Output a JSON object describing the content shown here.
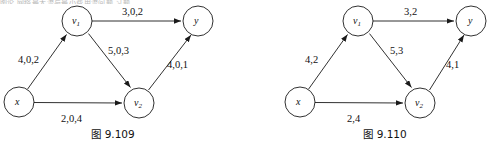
{
  "page": {
    "background_color": "#ffffff",
    "width": 490,
    "height": 151,
    "top_cut_text": "图论 网络最大流与最小费用流问题 习题"
  },
  "figures": [
    {
      "id": "fig-9-109",
      "caption": "图 9.109",
      "caption_x": 110,
      "caption_y": 128,
      "origin_x": 0,
      "stroke_color": "#1a1a1a",
      "nodes": [
        {
          "id": "x",
          "label": "x",
          "sub": "",
          "cx": 19,
          "cy": 102,
          "r": 15
        },
        {
          "id": "v1",
          "label": "v",
          "sub": "1",
          "cx": 77,
          "cy": 21,
          "r": 15
        },
        {
          "id": "v2",
          "label": "v",
          "sub": "2",
          "cx": 139,
          "cy": 103,
          "r": 15
        },
        {
          "id": "y",
          "label": "y",
          "sub": "",
          "cx": 198,
          "cy": 21,
          "r": 15
        }
      ],
      "edges": [
        {
          "id": "x-v1",
          "from": "x",
          "to": "v1",
          "label": "4,0,2",
          "label_x": 18,
          "label_y": 54
        },
        {
          "id": "v1-y",
          "from": "v1",
          "to": "y",
          "label": "3,0,2",
          "label_x": 122,
          "label_y": 6
        },
        {
          "id": "v1-v2",
          "from": "v1",
          "to": "v2",
          "label": "5,0,3",
          "label_x": 108,
          "label_y": 45
        },
        {
          "id": "x-v2",
          "from": "x",
          "to": "v2",
          "label": "2,0,4",
          "label_x": 61,
          "label_y": 113
        },
        {
          "id": "v2-y",
          "from": "v2",
          "to": "y",
          "label": "4,0,1",
          "label_x": 167,
          "label_y": 59
        }
      ]
    },
    {
      "id": "fig-9-110",
      "caption": "图 9.110",
      "caption_x": 355,
      "caption_y": 128,
      "origin_x": 281,
      "stroke_color": "#1a1a1a",
      "nodes": [
        {
          "id": "x",
          "label": "x",
          "sub": "",
          "cx": 300,
          "cy": 102,
          "r": 15
        },
        {
          "id": "v1",
          "label": "v",
          "sub": "1",
          "cx": 358,
          "cy": 21,
          "r": 15
        },
        {
          "id": "v2",
          "label": "v",
          "sub": "2",
          "cx": 420,
          "cy": 103,
          "r": 15
        },
        {
          "id": "y",
          "label": "y",
          "sub": "",
          "cx": 471,
          "cy": 21,
          "r": 15
        }
      ],
      "edges": [
        {
          "id": "x-v1",
          "from": "x",
          "to": "v1",
          "label": "4,2",
          "label_x": 305,
          "label_y": 54
        },
        {
          "id": "v1-y",
          "from": "v1",
          "to": "y",
          "label": "3,2",
          "label_x": 404,
          "label_y": 6
        },
        {
          "id": "v1-v2",
          "from": "v1",
          "to": "v2",
          "label": "5,3",
          "label_x": 390,
          "label_y": 45
        },
        {
          "id": "x-v2",
          "from": "x",
          "to": "v2",
          "label": "2,4",
          "label_x": 347,
          "label_y": 113
        },
        {
          "id": "v2-y",
          "from": "v2",
          "to": "y",
          "label": "4,1",
          "label_x": 446,
          "label_y": 59
        }
      ]
    }
  ]
}
